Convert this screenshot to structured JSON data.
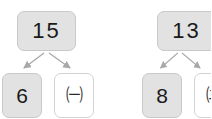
{
  "page": {
    "background_color": "#ffffff",
    "node_fill_color": "#e2e2e2",
    "node_border_color": "#cfcfcf",
    "arrow_color": "#a8a8a8",
    "text_color": "#1a1a1a"
  },
  "diagram": {
    "type": "number-bond",
    "groups": [
      {
        "id": "left",
        "whole": {
          "value": "15",
          "style": "filled"
        },
        "parts": [
          {
            "value": "6",
            "style": "filled"
          },
          {
            "value": "㈠",
            "style": "blank",
            "label": "circled-giyeok"
          }
        ]
      },
      {
        "id": "right",
        "whole": {
          "value": "13",
          "style": "filled"
        },
        "parts": [
          {
            "value": "8",
            "style": "filled"
          },
          {
            "value": "㈡",
            "style": "blank",
            "label": "circled-nieun"
          }
        ]
      }
    ]
  }
}
